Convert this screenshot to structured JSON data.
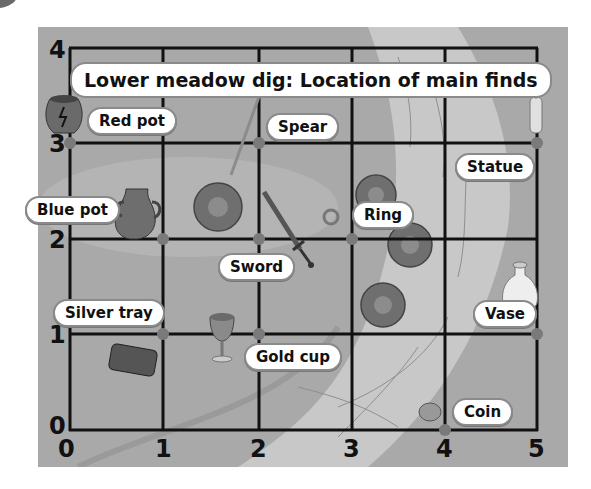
{
  "title": "Lower meadow dig: Location of main finds",
  "axes": {
    "x_ticks": [
      "0",
      "1",
      "2",
      "3",
      "4",
      "5"
    ],
    "y_ticks": [
      "0",
      "1",
      "2",
      "3",
      "4"
    ]
  },
  "finds": [
    {
      "name": "Red pot",
      "x": 0,
      "y": 3
    },
    {
      "name": "Spear",
      "x": 2,
      "y": 3
    },
    {
      "name": "Statue",
      "x": 5,
      "y": 3
    },
    {
      "name": "Blue pot",
      "x": 1,
      "y": 2
    },
    {
      "name": "Sword",
      "x": 2,
      "y": 2
    },
    {
      "name": "Ring",
      "x": 3,
      "y": 2
    },
    {
      "name": "Silver tray",
      "x": 1,
      "y": 1
    },
    {
      "name": "Gold cup",
      "x": 2,
      "y": 1
    },
    {
      "name": "Vase",
      "x": 5,
      "y": 1
    },
    {
      "name": "Coin",
      "x": 4,
      "y": 0
    }
  ],
  "colors": {
    "panel": "#a9a9a9",
    "river": "#c8c8c8",
    "grid": "#111111",
    "point": "#7a7a7a",
    "bush": "#6f6f6f"
  }
}
